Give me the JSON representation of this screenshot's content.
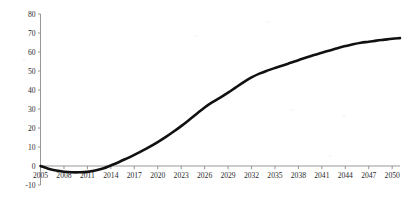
{
  "chart_data": {
    "type": "line",
    "title": "",
    "subtitle": "",
    "xlabel": "",
    "ylabel": "",
    "xlim": [
      2005,
      2051
    ],
    "ylim": [
      -10,
      80
    ],
    "grid": false,
    "legend": null,
    "legend_position": "none",
    "y_ticks": [
      -10,
      0,
      10,
      20,
      30,
      40,
      50,
      60,
      70,
      80
    ],
    "y_tick_labels": [
      "-10",
      "0",
      "10",
      "20",
      "30",
      "40",
      "50",
      "60",
      "70",
      "80"
    ],
    "x_ticks": [
      2005,
      2008,
      2011,
      2014,
      2017,
      2020,
      2023,
      2026,
      2029,
      2032,
      2035,
      2038,
      2041,
      2044,
      2047,
      2050
    ],
    "x_tick_labels": [
      "2005",
      "2008",
      "2011",
      "2014",
      "2017",
      "2020",
      "2023",
      "2026",
      "2029",
      "2032",
      "2035",
      "2038",
      "2041",
      "2044",
      "2047",
      "2050"
    ],
    "series": [
      {
        "name": "",
        "color": "#111111",
        "x": [
          2005,
          2006,
          2007,
          2008,
          2009,
          2010,
          2011,
          2012,
          2013,
          2014,
          2015,
          2016,
          2017,
          2018,
          2019,
          2020,
          2021,
          2022,
          2023,
          2024,
          2025,
          2026,
          2027,
          2028,
          2029,
          2030,
          2031,
          2032,
          2033,
          2034,
          2035,
          2036,
          2037,
          2038,
          2039,
          2040,
          2041,
          2042,
          2043,
          2044,
          2045,
          2046,
          2047,
          2048,
          2049,
          2050,
          2051
        ],
        "values": [
          0,
          -1.4,
          -2.4,
          -3,
          -3.3,
          -3.3,
          -3.1,
          -2.4,
          -1.3,
          0.3,
          2,
          3.9,
          5.9,
          8,
          10.2,
          12.6,
          15.2,
          18,
          21,
          24.2,
          27.5,
          30.8,
          33.6,
          36,
          38.6,
          41.4,
          44.1,
          46.6,
          48.6,
          50.2,
          51.6,
          52.9,
          54.3,
          55.7,
          57.1,
          58.4,
          59.6,
          60.8,
          62,
          63.1,
          64.1,
          64.9,
          65.4,
          66,
          66.5,
          67,
          67.3
        ]
      }
    ],
    "annotations": {
      "zero_crossing_year": 2013,
      "minimum_value": -3.3,
      "minimum_year": 2009,
      "final_value": 67.3,
      "final_year": 2051
    }
  },
  "axes": {
    "y_axis_name": "value-axis",
    "x_axis_name": "year-axis"
  }
}
